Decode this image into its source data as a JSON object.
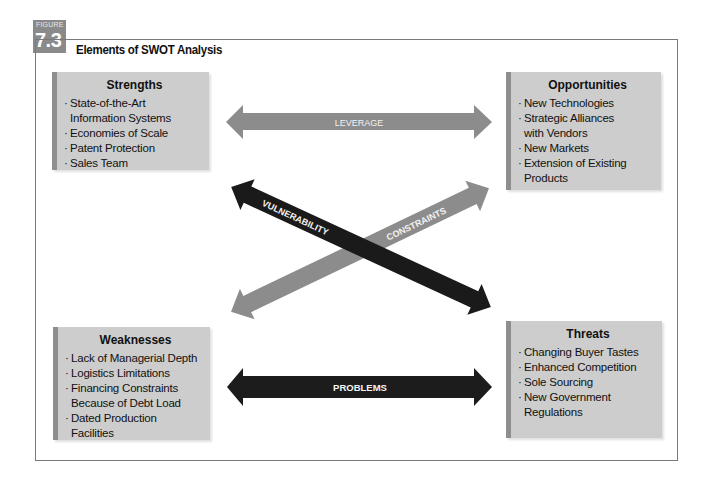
{
  "figure": {
    "badge_label": "FIGURE",
    "badge_number": "7.3",
    "title": "Elements of SWOT Analysis"
  },
  "colors": {
    "box_fill": "#cdcdcd",
    "box_bevel": "#8e8e8e",
    "light_arrow": "#8c8c8c",
    "dark_arrow": "#1a1a1a",
    "frame": "#7a7a7a"
  },
  "quadrants": {
    "strengths": {
      "title": "Strengths",
      "items": [
        "State-of-the-Art Information Systems",
        "Economies of Scale",
        "Patent Protection",
        "Sales Team"
      ]
    },
    "opportunities": {
      "title": "Opportunities",
      "items": [
        "New Technologies",
        "Strategic Alliances with Vendors",
        "New Markets",
        "Extension of Existing Products"
      ]
    },
    "weaknesses": {
      "title": "Weaknesses",
      "items": [
        "Lack of Managerial Depth",
        "Logistics Limitations",
        "Financing Constraints Because of Debt Load",
        "Dated Production Facilities"
      ]
    },
    "threats": {
      "title": "Threats",
      "items": [
        "Changing Buyer Tastes",
        "Enhanced Competition",
        "Sole Sourcing",
        "New Government Regulations"
      ]
    }
  },
  "arrows": {
    "leverage": "LEVERAGE",
    "problems": "PROBLEMS",
    "vulnerability": "VULNERABILITY",
    "constraints": "CONSTRAINTS"
  }
}
